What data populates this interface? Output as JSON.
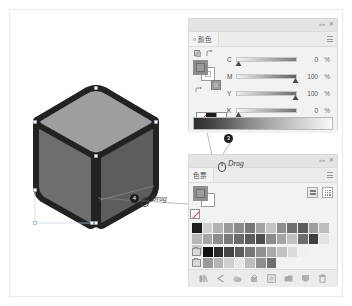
{
  "color_panel": {
    "tab_label": "颜色",
    "collapse_icon": "chevrons-right-icon",
    "close_icon": "close-icon",
    "menu_icon": "panel-menu-icon",
    "swap_icon": "swap-fill-stroke-icon",
    "tool_icons": [
      "fill-indicator-icon",
      "stroke-indicator-icon"
    ],
    "sliders": [
      {
        "label": "C",
        "value": "0",
        "unit": "%",
        "pos": 3
      },
      {
        "label": "M",
        "value": "100",
        "unit": "%",
        "pos": 100
      },
      {
        "label": "Y",
        "value": "100",
        "unit": "%",
        "pos": 100
      },
      {
        "label": "K",
        "value": "0",
        "unit": "%",
        "pos": 3
      }
    ],
    "spectrum_name": "color-spectrum-bar"
  },
  "swatches_panel": {
    "tab_label": "色票",
    "collapse_icon": "chevrons-right-icon",
    "close_icon": "close-icon",
    "menu_icon": "panel-menu-icon",
    "view_list_icon": "list-view-icon",
    "view_grid_icon": "grid-view-icon",
    "row1": [
      "#1f1f1f",
      "#cfcfcf",
      "#b3b3b3",
      "#9a9a9a",
      "#8a8a8a",
      "#777777",
      "#a2a2a2",
      "#c4c4c4",
      "#8e8e8e",
      "#6f6f6f",
      "#5c5c5c",
      "#9d9d9d",
      "#bdbdbd",
      "#d5d5d5"
    ],
    "row2": [
      "#b8b8b8",
      "#a6a6a6",
      "#8d8d8d",
      "#7a7a7a",
      "#6a6a6a",
      "#5b5b5b",
      "#4d4d4d",
      "#8b8b8b",
      "#a4a4a4",
      "#c0c0c0",
      "#6d6d6d",
      "#3f3f3f",
      "#e2e2e2",
      "#cbcbcb"
    ],
    "ramp1": [
      "#111111",
      "#2b2b2b",
      "#444444",
      "#5e5e5e",
      "#777777",
      "#909090",
      "#a9a9a9",
      "#c2c2c2",
      "#dbdbdb",
      "#f0f0f0"
    ],
    "ramp2": [
      "#9b9b9b",
      "#b5b5b5",
      "#cfcfcf",
      "#e8e8e8",
      "#bdbdbd",
      "#8f8f8f",
      "#6e6e6e"
    ],
    "bottom_icons": [
      "swatch-libraries-icon",
      "show-swatch-kinds-icon",
      "color-group-icon",
      "edit-swatch-icon",
      "new-color-group-icon",
      "new-swatch-folder-icon",
      "new-swatch-icon",
      "delete-swatch-icon"
    ]
  },
  "annotations": [
    {
      "number": "3",
      "mouse_icon": "mouse-icon",
      "action": "Drag"
    },
    {
      "number": "4",
      "mouse_icon": "mouse-icon",
      "action": "Drag"
    }
  ],
  "artwork": {
    "name": "isometric-rounded-cube",
    "outline_color": "#222222",
    "top_face_color": "#9e9e9e",
    "left_face_color": "#6e6e6e",
    "right_face_color": "#5d5d5d"
  }
}
